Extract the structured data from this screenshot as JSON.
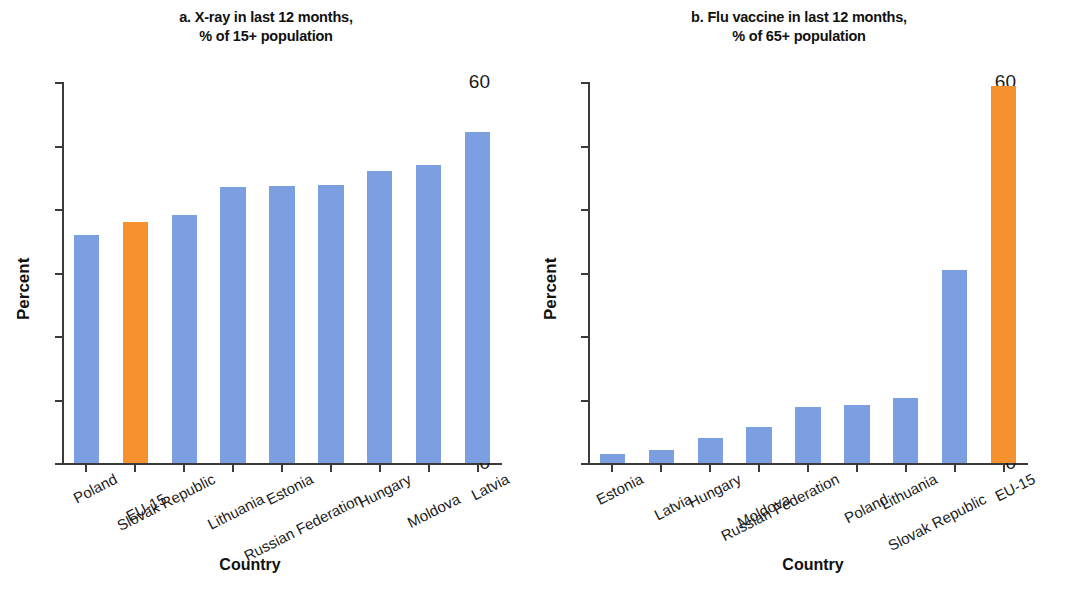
{
  "figure": {
    "y_axis_title": "Percent",
    "x_axis_title": "Country",
    "colors": {
      "bar_blue": "#7b9fe0",
      "bar_orange": "#f5912e",
      "axis": "#3a3a3a",
      "text": "#1a1a1a"
    }
  },
  "panel_a": {
    "title_line1": "a. X-ray in last 12 months,",
    "title_line2": "% of 15+ population",
    "y_axis_title": "Percent",
    "x_axis_title": "Country",
    "yticks": [
      "0",
      "10",
      "20",
      "30",
      "40",
      "50",
      "60"
    ]
  },
  "panel_b": {
    "title_line1": "b. Flu vaccine in last 12 months,",
    "title_line2": "% of 65+ population",
    "y_axis_title": "Percent",
    "x_axis_title": "Country",
    "yticks": [
      "0",
      "10",
      "20",
      "30",
      "40",
      "50",
      "60"
    ]
  },
  "chart_data": [
    {
      "type": "bar",
      "panel": "a",
      "title": "a. X-ray in last 12 months, % of 15+ population",
      "xlabel": "Country",
      "ylabel": "Percent",
      "ylim": [
        0,
        60
      ],
      "yticks": [
        0,
        10,
        20,
        30,
        40,
        50,
        60
      ],
      "grid": false,
      "legend": "none",
      "categories": [
        "Poland",
        "EU-15",
        "Slovak Republic",
        "Lithuania",
        "Estonia",
        "Russian Federation",
        "Hungary",
        "Moldova",
        "Latvia"
      ],
      "values": [
        35.9,
        38.0,
        39.0,
        43.4,
        43.7,
        43.8,
        46.0,
        47.0,
        52.2
      ],
      "highlight": [
        "EU-15"
      ],
      "bar_colors": [
        "#7b9fe0",
        "#f5912e",
        "#7b9fe0",
        "#7b9fe0",
        "#7b9fe0",
        "#7b9fe0",
        "#7b9fe0",
        "#7b9fe0",
        "#7b9fe0"
      ]
    },
    {
      "type": "bar",
      "panel": "b",
      "title": "b. Flu vaccine in last 12 months, % of 65+ population",
      "xlabel": "Country",
      "ylabel": "Percent",
      "ylim": [
        0,
        60
      ],
      "yticks": [
        0,
        10,
        20,
        30,
        40,
        50,
        60
      ],
      "grid": false,
      "legend": "none",
      "categories": [
        "Estonia",
        "Latvia",
        "Hungary",
        "Moldova",
        "Russian Federation",
        "Poland",
        "Lithuania",
        "Slovak Republic",
        "EU-15"
      ],
      "values": [
        1.4,
        2.1,
        3.9,
        5.7,
        8.9,
        9.2,
        10.3,
        30.4,
        59.4
      ],
      "highlight": [
        "EU-15"
      ],
      "bar_colors": [
        "#7b9fe0",
        "#7b9fe0",
        "#7b9fe0",
        "#7b9fe0",
        "#7b9fe0",
        "#7b9fe0",
        "#7b9fe0",
        "#7b9fe0",
        "#f5912e"
      ]
    }
  ]
}
